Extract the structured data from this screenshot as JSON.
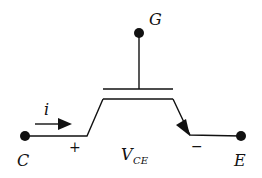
{
  "diagram": {
    "terminals": {
      "gate": "G",
      "collector": "C",
      "emitter": "E"
    },
    "current_label": "i",
    "voltage": {
      "symbol": "V",
      "subscript": "CE",
      "plus": "+",
      "minus": "−"
    },
    "colors": {
      "stroke": "#111111",
      "background": "#ffffff"
    }
  }
}
